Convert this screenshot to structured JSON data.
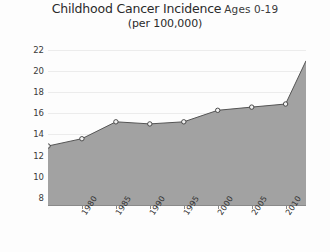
{
  "chart_data": {
    "type": "area",
    "title": "Childhood Cancer Incidence",
    "title_suffix": "Ages 0-19",
    "subtitle": "(per 100,000)",
    "xlabel": "",
    "ylabel": "",
    "xlim": [
      1975,
      2013
    ],
    "ylim": [
      7.2,
      22.6
    ],
    "grid": true,
    "legend": "none",
    "fill_color": "#a2a2a2",
    "line_color": "#555555",
    "marker_color": "#f2f2f2",
    "marker_edge_color": "#3c3c3c",
    "background_color": "#fdfdfd",
    "gridline_color": "#ececec",
    "axis_color": "#8a8a8a",
    "ytick_labels": [
      "22",
      "20",
      "18",
      "16",
      "14",
      "12",
      "10",
      "8"
    ],
    "ytick_values": [
      22,
      20,
      18,
      16,
      14,
      12,
      10,
      8
    ],
    "xtick_labels": [
      "1980",
      "1985",
      "1990",
      "1995",
      "2000",
      "2005",
      "2010"
    ],
    "xtick_values": [
      1980,
      1985,
      1990,
      1995,
      2000,
      2005,
      2010
    ],
    "x": [
      1975,
      1980,
      1985,
      1990,
      1995,
      2000,
      2005,
      2010,
      2013
    ],
    "values": [
      12.9,
      13.6,
      15.2,
      15.0,
      15.2,
      16.3,
      16.6,
      16.9,
      21.0
    ],
    "marker_points": [
      {
        "x": 1975,
        "y": 12.9
      },
      {
        "x": 1980,
        "y": 13.6
      },
      {
        "x": 1985,
        "y": 15.2
      },
      {
        "x": 1990,
        "y": 15.0
      },
      {
        "x": 1995,
        "y": 15.2
      },
      {
        "x": 2000,
        "y": 16.3
      },
      {
        "x": 2005,
        "y": 16.6
      },
      {
        "x": 2010,
        "y": 16.9
      }
    ]
  }
}
